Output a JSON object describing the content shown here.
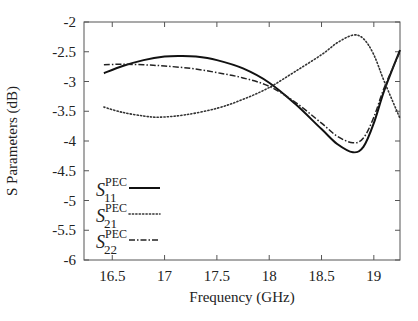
{
  "chart_data": {
    "type": "line",
    "title": "",
    "xlabel": "Frequency (GHz)",
    "ylabel": "S Parameters (dB)",
    "xlim": [
      16.23,
      19.25
    ],
    "ylim": [
      -6,
      -2
    ],
    "xticks": [
      16.5,
      17,
      17.5,
      18,
      18.5,
      19
    ],
    "xtick_labels": [
      "16.5",
      "17",
      "17.5",
      "18",
      "18.5",
      "19"
    ],
    "yticks": [
      -2,
      -2.5,
      -3,
      -3.5,
      -4,
      -4.5,
      -5,
      -5.5,
      -6
    ],
    "ytick_labels": [
      "-2",
      "-2.5",
      "-3",
      "-3.5",
      "-4",
      "-4.5",
      "-5",
      "-5.5",
      "-6"
    ],
    "grid": false,
    "legend_position": "lower left",
    "series": [
      {
        "name": "S11 PEC",
        "label_main": "S",
        "label_sup": "PEC",
        "label_sub": "11",
        "style": "solid",
        "x": [
          16.42,
          16.6,
          16.8,
          17.0,
          17.15,
          17.3,
          17.5,
          17.75,
          18.0,
          18.25,
          18.5,
          18.65,
          18.8,
          18.9,
          19.0,
          19.1,
          19.25
        ],
        "y": [
          -2.86,
          -2.74,
          -2.64,
          -2.58,
          -2.57,
          -2.58,
          -2.64,
          -2.78,
          -3.02,
          -3.38,
          -3.8,
          -4.05,
          -4.19,
          -4.1,
          -3.7,
          -3.15,
          -2.47
        ]
      },
      {
        "name": "S21 PEC",
        "label_main": "S",
        "label_sup": "PEC",
        "label_sub": "21",
        "style": "dotted",
        "x": [
          16.42,
          16.6,
          16.8,
          16.95,
          17.2,
          17.5,
          17.75,
          18.0,
          18.25,
          18.5,
          18.65,
          18.8,
          18.9,
          19.0,
          19.1,
          19.25
        ],
        "y": [
          -3.43,
          -3.52,
          -3.58,
          -3.6,
          -3.56,
          -3.45,
          -3.3,
          -3.1,
          -2.83,
          -2.55,
          -2.35,
          -2.22,
          -2.28,
          -2.55,
          -3.0,
          -3.62
        ]
      },
      {
        "name": "S22 PEC",
        "label_main": "S",
        "label_sup": "PEC",
        "label_sub": "22",
        "style": "dashdot",
        "x": [
          16.42,
          16.6,
          16.8,
          17.0,
          17.25,
          17.5,
          17.75,
          18.0,
          18.25,
          18.5,
          18.65,
          18.8,
          18.9,
          19.0,
          19.1,
          19.25
        ],
        "y": [
          -2.72,
          -2.71,
          -2.72,
          -2.74,
          -2.78,
          -2.85,
          -2.94,
          -3.08,
          -3.35,
          -3.7,
          -3.92,
          -4.03,
          -3.95,
          -3.6,
          -3.1,
          -2.5
        ]
      }
    ]
  }
}
